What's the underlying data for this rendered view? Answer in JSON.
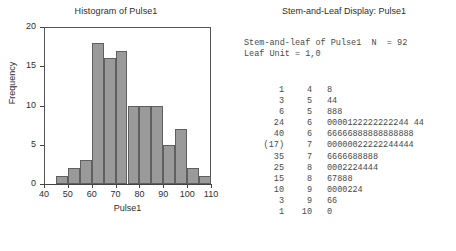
{
  "histogram": {
    "title": "Histogram of Pulse1",
    "xlabel": "Pulse1",
    "ylabel": "Frequency",
    "x_ticks": [
      "40",
      "50",
      "60",
      "70",
      "80",
      "90",
      "100",
      "110"
    ],
    "y_ticks": [
      "0",
      "5",
      "10",
      "15",
      "20"
    ]
  },
  "stemleaf": {
    "title": "Stem-and-Leaf Display: Pulse1",
    "header_line1": "Stem-and-leaf of Pulse1  N  = 92",
    "header_line2": "Leaf Unit = 1,0",
    "rows": [
      {
        "count": "1",
        "stem": "4",
        "leaves": "8"
      },
      {
        "count": "3",
        "stem": "5",
        "leaves": "44"
      },
      {
        "count": "6",
        "stem": "5",
        "leaves": "888"
      },
      {
        "count": "24",
        "stem": "6",
        "leaves": "0000122222222244 44"
      },
      {
        "count": "40",
        "stem": "6",
        "leaves": "66666888888888888"
      },
      {
        "count": "(17)",
        "stem": "7",
        "leaves": "00000022222244444"
      },
      {
        "count": "35",
        "stem": "7",
        "leaves": "6666688888"
      },
      {
        "count": "25",
        "stem": "8",
        "leaves": "0002224444"
      },
      {
        "count": "15",
        "stem": "8",
        "leaves": "67888"
      },
      {
        "count": "10",
        "stem": "9",
        "leaves": "0000224"
      },
      {
        "count": "3",
        "stem": "9",
        "leaves": "66"
      },
      {
        "count": "1",
        "stem": "10",
        "leaves": "0"
      }
    ]
  },
  "chart_data": {
    "type": "bar",
    "title": "Histogram of Pulse1",
    "xlabel": "Pulse1",
    "ylabel": "Frequency",
    "xlim": [
      40,
      110
    ],
    "ylim": [
      0,
      20
    ],
    "grid": false,
    "legend": "none",
    "bin_width": 5,
    "bin_edges": [
      45,
      50,
      55,
      60,
      65,
      70,
      75,
      80,
      85,
      90,
      95,
      100,
      105,
      110
    ],
    "categories": [
      "45-50",
      "50-55",
      "55-60",
      "60-65",
      "65-70",
      "70-75",
      "75-80",
      "80-85",
      "85-90",
      "90-95",
      "95-100",
      "100-105",
      "105-110"
    ],
    "values": [
      1,
      2,
      3,
      18,
      16,
      17,
      10,
      10,
      10,
      5,
      7,
      2,
      1
    ],
    "bar_color": "#9a9a9a",
    "bar_edge_color": "#5f5f5f",
    "x_tick_values": [
      40,
      50,
      60,
      70,
      80,
      90,
      100,
      110
    ],
    "y_tick_values": [
      0,
      5,
      10,
      15,
      20
    ]
  }
}
